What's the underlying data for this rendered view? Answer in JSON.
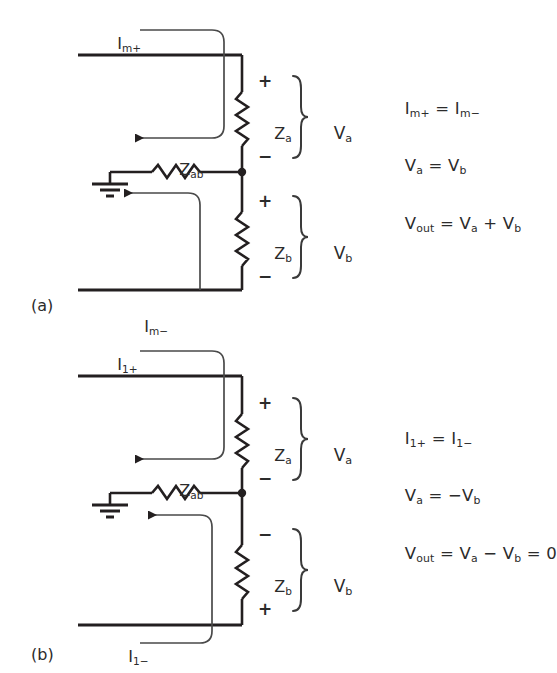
{
  "figure": {
    "type": "circuit-diagram",
    "background_color": "#ffffff",
    "line_color": "#231f20",
    "text_color": "#2b2b2b"
  },
  "panels": [
    {
      "id": "a",
      "tag": "(a)",
      "currents": {
        "top_label": "I",
        "top_sub": "m+",
        "bottom_label": "I",
        "bottom_sub": "m−"
      },
      "components": [
        {
          "name": "Za",
          "label": "Z",
          "sub": "a",
          "orientation": "vertical"
        },
        {
          "name": "Zb",
          "label": "Z",
          "sub": "b",
          "orientation": "vertical"
        },
        {
          "name": "Zab",
          "label": "Z",
          "sub": "ab",
          "orientation": "horizontal"
        }
      ],
      "voltages": [
        {
          "name": "Va",
          "label": "V",
          "sub": "a",
          "plus_position": "top",
          "minus_position": "bottom"
        },
        {
          "name": "Vb",
          "label": "V",
          "sub": "b",
          "plus_position": "top",
          "minus_position": "bottom"
        }
      ],
      "polarity_marks": {
        "za_top": "+",
        "za_bottom": "−",
        "zb_top": "+",
        "zb_bottom": "−"
      },
      "equations": [
        {
          "lhs": "I",
          "lhs_sub": "m+",
          "op": "=",
          "rhs": "I",
          "rhs_sub": "m−",
          "text": "Iₘ₊ = Iₘ₋"
        },
        {
          "lhs": "V",
          "lhs_sub": "a",
          "op": "=",
          "rhs": "V",
          "rhs_sub": "b",
          "text": "Vₐ = Vᵇ"
        },
        {
          "lhs": "V",
          "lhs_sub": "out",
          "op": "=",
          "rhs": "Vₐ + Vᵇ",
          "text": "Vₒᵤₜ = Vₐ + Vᵇ"
        }
      ],
      "ground": "earth-ground"
    },
    {
      "id": "b",
      "tag": "(b)",
      "currents": {
        "top_label": "I",
        "top_sub": "1+",
        "bottom_label": "I",
        "bottom_sub": "1−"
      },
      "components": [
        {
          "name": "Za",
          "label": "Z",
          "sub": "a",
          "orientation": "vertical"
        },
        {
          "name": "Zb",
          "label": "Z",
          "sub": "b",
          "orientation": "vertical"
        },
        {
          "name": "Zab",
          "label": "Z",
          "sub": "ab",
          "orientation": "horizontal"
        }
      ],
      "voltages": [
        {
          "name": "Va",
          "label": "V",
          "sub": "a",
          "plus_position": "top",
          "minus_position": "bottom"
        },
        {
          "name": "Vb",
          "label": "V",
          "sub": "b",
          "plus_position": "bottom",
          "minus_position": "top"
        }
      ],
      "polarity_marks": {
        "za_top": "+",
        "za_bottom": "−",
        "zb_top": "−",
        "zb_bottom": "+"
      },
      "equations": [
        {
          "lhs": "I",
          "lhs_sub": "1+",
          "op": "=",
          "rhs": "I",
          "rhs_sub": "1−",
          "text": "I₁₊ = I₁₋"
        },
        {
          "lhs": "V",
          "lhs_sub": "a",
          "op": "=",
          "rhs": "−V",
          "rhs_sub": "b",
          "text": "Vₐ = −Vᵇ"
        },
        {
          "lhs": "V",
          "lhs_sub": "out",
          "op": "=",
          "rhs": "Vₐ − Vᵇ = 0",
          "text": "Vₒᵤₜ = Vₐ − Vᵇ = 0"
        }
      ],
      "ground": "earth-ground"
    }
  ],
  "text": {
    "panel_a_tag": "(a)",
    "panel_b_tag": "(b)",
    "Z": "Z",
    "V": "V",
    "I": "I",
    "sub_a": "a",
    "sub_b": "b",
    "sub_ab": "ab",
    "sub_out": "out",
    "sub_m_plus": "m+",
    "sub_m_minus": "m−",
    "sub_1_plus": "1+",
    "sub_1_minus": "1−",
    "plus": "+",
    "minus": "−",
    "equals": "=",
    "zero": "0"
  }
}
